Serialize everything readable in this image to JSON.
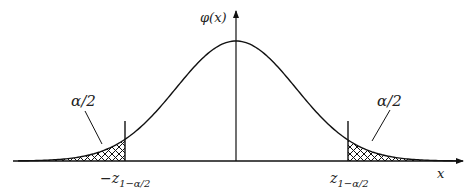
{
  "figure": {
    "type": "normal-distribution-two-tailed",
    "y_axis_label": "φ(x)",
    "x_axis_label": "x",
    "left_tail_label": "α/2",
    "right_tail_label": "α/2",
    "left_cutoff_label_sign": "−",
    "left_cutoff_label_main": "z",
    "left_cutoff_label_sub": "1−α/2",
    "right_cutoff_label_main": "z",
    "right_cutoff_label_sub": "1−α/2",
    "colors": {
      "stroke": "#111111",
      "hatch": "#111111",
      "background": "#ffffff"
    }
  }
}
